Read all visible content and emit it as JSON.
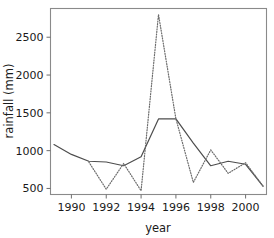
{
  "chart_data": {
    "type": "line",
    "title": "",
    "xlabel": "year",
    "ylabel": "rainfall (mm)",
    "xlim": [
      1988.8,
      2001.2
    ],
    "ylim": [
      420,
      2880
    ],
    "grid": false,
    "legend": "none",
    "x": [
      1989,
      1990,
      1991,
      1992,
      1993,
      1994,
      1995,
      1996,
      1997,
      1998,
      1999,
      2000,
      2001
    ],
    "xticks": [
      1990,
      1992,
      1994,
      1996,
      1998,
      2000
    ],
    "xtick_labels": [
      "1990",
      "1992",
      "1994",
      "1996",
      "1998",
      "2000"
    ],
    "yticks": [
      500,
      1000,
      1500,
      2000,
      2500
    ],
    "ytick_labels": [
      "500",
      "1000",
      "1500",
      "2000",
      "2500"
    ],
    "series": [
      {
        "name": "solid",
        "style": "solid",
        "color": "#4d4d4d",
        "x": [
          1989,
          1990,
          1991,
          1992,
          1993,
          1994,
          1995,
          1996,
          1997,
          1998,
          1999,
          2000,
          2001
        ],
        "values": [
          1080,
          950,
          860,
          850,
          800,
          920,
          1420,
          1420,
          1100,
          800,
          860,
          820,
          530
        ]
      },
      {
        "name": "dotted",
        "style": "dotted",
        "color": "#6b6b6b",
        "x": [
          1991,
          1992,
          1993,
          1994,
          1995,
          1996,
          1997,
          1998,
          1999,
          2000,
          2001
        ],
        "values": [
          850,
          490,
          830,
          470,
          2800,
          1420,
          580,
          1010,
          700,
          840,
          530
        ]
      }
    ]
  },
  "axes": {
    "x_title": "year",
    "y_title": "rainfall (mm)"
  }
}
